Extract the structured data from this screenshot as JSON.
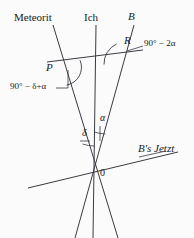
{
  "figure": {
    "title_alt": "Relativity spacetime diagram with meteor, observer and B worldlines",
    "background_color": "#fbfbfb",
    "line_color": "#3a3a42",
    "width": 194,
    "height": 238
  },
  "labels": {
    "meteorit": "Meteorit",
    "ich": "Ich",
    "b_line": "B",
    "point_p": "P",
    "point_r": "R",
    "origin": "0",
    "b_jetzt": "B's Jetzt",
    "angle_r": "90° − 2α",
    "angle_p": "90° − δ+α",
    "angle_delta": "δ",
    "angle_alpha": "α"
  },
  "geometry": {
    "origin": {
      "x": 95,
      "y": 172
    },
    "point_p": {
      "x": 62,
      "y": 68
    },
    "point_r": {
      "x": 128,
      "y": 43
    },
    "worldlines": [
      {
        "name": "meteorit",
        "x1": 53,
        "y1": 25,
        "x2": 118,
        "y2": 238
      },
      {
        "name": "ich",
        "x1": 96,
        "y1": 25,
        "x2": 93,
        "y2": 238
      },
      {
        "name": "b",
        "x1": 134,
        "y1": 25,
        "x2": 75,
        "y2": 238
      }
    ],
    "segments": [
      {
        "name": "pr-line",
        "x1": 47,
        "y1": 62,
        "x2": 143,
        "y2": 50
      },
      {
        "name": "b-jetzt-line",
        "x1": 28,
        "y1": 188,
        "x2": 178,
        "y2": 152
      }
    ]
  }
}
